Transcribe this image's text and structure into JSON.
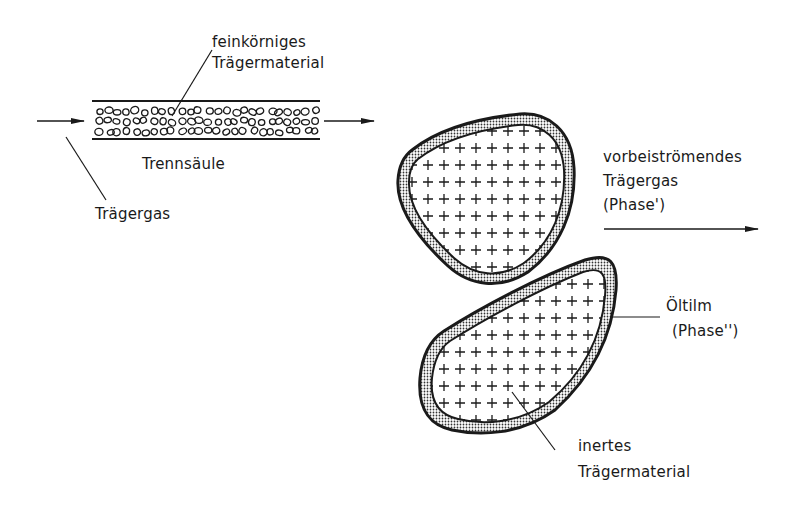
{
  "diagram": {
    "title": "",
    "column": {
      "label": "Trennsäule",
      "packing_label_line1": "feinkörniges",
      "packing_label_line2": "Trägermaterial",
      "carrier_gas_label": "Trägergas"
    },
    "particles": {
      "flow_label_line1": "vorbeiströmendes",
      "flow_label_line2": "Trägergas",
      "flow_label_line3": "(Phase')",
      "film_label_line1": "Öltilm",
      "film_label_line2": "(Phase'')",
      "inert_label_line1": "inertes",
      "inert_label_line2": "Trägermaterial"
    },
    "colors": {
      "ink": "#1a1a1a",
      "background": "#ffffff",
      "film_fill": "#d9d9d9"
    }
  }
}
